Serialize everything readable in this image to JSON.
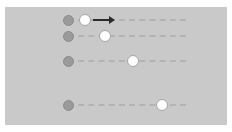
{
  "scene": {
    "title": "Motion tracks diagram",
    "background_color": "#ffffff",
    "panel_color": "#c9c9c9",
    "panel": {
      "x": 5,
      "y": 7,
      "width": 222,
      "height": 118
    }
  },
  "style": {
    "origin_color": "#9a9a9a",
    "origin_border_color": "#8c8c8c",
    "token_color": "#fdfdfd",
    "token_border_color": "#a6a6a6",
    "path_color": "#b0b0b0",
    "arrow_color": "#2b2b2b"
  },
  "tracks": [
    {
      "label": "track-1",
      "y": 20,
      "origin": {
        "x": 68,
        "diameter": 11
      },
      "path": {
        "start": 68,
        "end": 186
      },
      "token": {
        "x": 85,
        "diameter": 12
      },
      "arrow": {
        "from": 93,
        "to": 115
      },
      "has_arrow": true
    },
    {
      "label": "track-2",
      "y": 36,
      "origin": {
        "x": 68,
        "diameter": 11
      },
      "path": {
        "start": 68,
        "end": 186
      },
      "token": {
        "x": 105,
        "diameter": 12
      },
      "has_arrow": false
    },
    {
      "label": "track-3",
      "y": 61,
      "origin": {
        "x": 68,
        "diameter": 11
      },
      "path": {
        "start": 68,
        "end": 186
      },
      "token": {
        "x": 133,
        "diameter": 12
      },
      "has_arrow": false
    },
    {
      "label": "track-4",
      "y": 105,
      "origin": {
        "x": 68,
        "diameter": 11
      },
      "path": {
        "start": 68,
        "end": 186
      },
      "token": {
        "x": 162,
        "diameter": 12
      },
      "has_arrow": false
    }
  ]
}
